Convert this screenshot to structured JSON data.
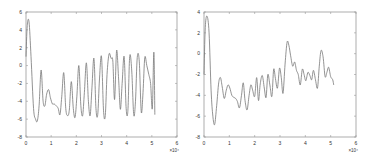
{
  "chart_data": [
    {
      "type": "line",
      "title": "",
      "xlabel": "",
      "ylabel": "",
      "x_exponent_label": "×10⁴",
      "xlim": [
        0,
        6
      ],
      "ylim": [
        -8,
        6
      ],
      "xticks": [
        "0",
        "1",
        "2",
        "3",
        "4",
        "5",
        "6"
      ],
      "yticks": [
        "6",
        "4",
        "2",
        "0",
        "-2",
        "-4",
        "-6",
        "-8"
      ],
      "ytick_values": [
        6,
        4,
        2,
        0,
        -2,
        -4,
        -6,
        -8
      ],
      "grid": false,
      "legend": null,
      "line_color": "#777777",
      "series": [
        {
          "name": "signal-1",
          "x": [
            0,
            0.05,
            0.12,
            0.2,
            0.3,
            0.38,
            0.45,
            0.52,
            0.6,
            0.68,
            0.75,
            0.82,
            0.9,
            0.97,
            1.05,
            1.12,
            1.2,
            1.28,
            1.35,
            1.42,
            1.5,
            1.58,
            1.65,
            1.72,
            1.8,
            1.88,
            1.95,
            2.02,
            2.1,
            2.18,
            2.25,
            2.32,
            2.4,
            2.48,
            2.55,
            2.62,
            2.7,
            2.78,
            2.85,
            2.92,
            3.0,
            3.08,
            3.15,
            3.22,
            3.3,
            3.38,
            3.45,
            3.52,
            3.6,
            3.68,
            3.75,
            3.82,
            3.9,
            3.98,
            4.05,
            4.12,
            4.2,
            4.28,
            4.35,
            4.42,
            4.5,
            4.58,
            4.65,
            4.72,
            4.8,
            4.88,
            4.95,
            5.02,
            5.08,
            5.12
          ],
          "y": [
            1.0,
            4.5,
            4.9,
            1.0,
            -4.8,
            -6.0,
            -6.2,
            -4.5,
            -0.5,
            -4.0,
            -4.5,
            -3.2,
            -2.7,
            -3.6,
            -4.3,
            -4.3,
            -4.5,
            -4.8,
            -5.5,
            -3.5,
            -0.8,
            -4.8,
            -5.6,
            -5.0,
            -1.8,
            -4.8,
            -5.8,
            -3.5,
            0.0,
            -4.5,
            -5.6,
            -3.0,
            0.3,
            -4.0,
            -5.6,
            -2.5,
            0.8,
            -4.8,
            -5.5,
            -1.5,
            1.0,
            -5.0,
            -5.6,
            -1.0,
            1.3,
            0.8,
            0.5,
            -3.8,
            1.7,
            -1.5,
            -4.9,
            -2.0,
            1.0,
            -4.8,
            -5.0,
            1.0,
            -0.5,
            -5.5,
            -4.0,
            0.9,
            0.5,
            -5.2,
            -3.0,
            0.9,
            0.0,
            -1.0,
            -2.0,
            -4.8,
            1.5,
            -5.5,
            1.2
          ]
        }
      ]
    },
    {
      "type": "line",
      "title": "",
      "xlabel": "",
      "ylabel": "",
      "x_exponent_label": "×10⁴",
      "xlim": [
        0,
        6
      ],
      "ylim": [
        -8,
        4
      ],
      "xticks": [
        "0",
        "1",
        "2",
        "3",
        "4",
        "5",
        "6"
      ],
      "yticks": [
        "4",
        "2",
        "0",
        "-2",
        "-4",
        "-6",
        "-8"
      ],
      "ytick_values": [
        4,
        2,
        0,
        -2,
        -4,
        -6,
        -8
      ],
      "grid": false,
      "legend": null,
      "line_color": "#777777",
      "series": [
        {
          "name": "signal-2",
          "x": [
            0,
            0.05,
            0.12,
            0.2,
            0.28,
            0.35,
            0.42,
            0.5,
            0.58,
            0.65,
            0.72,
            0.8,
            0.88,
            0.95,
            1.02,
            1.1,
            1.18,
            1.25,
            1.32,
            1.4,
            1.48,
            1.55,
            1.62,
            1.7,
            1.78,
            1.85,
            1.92,
            2.0,
            2.08,
            2.15,
            2.22,
            2.3,
            2.38,
            2.45,
            2.52,
            2.6,
            2.68,
            2.75,
            2.82,
            2.9,
            2.98,
            3.05,
            3.12,
            3.2,
            3.28,
            3.35,
            3.42,
            3.5,
            3.58,
            3.65,
            3.72,
            3.8,
            3.88,
            3.95,
            4.02,
            4.1,
            4.18,
            4.25,
            4.32,
            4.4,
            4.48,
            4.55,
            4.62,
            4.7,
            4.78,
            4.85,
            4.92,
            5.0,
            5.08,
            5.12
          ],
          "y": [
            -2.0,
            2.5,
            3.6,
            2.0,
            -3.5,
            -6.0,
            -6.8,
            -5.0,
            -2.8,
            -2.3,
            -3.2,
            -4.3,
            -3.5,
            -3.0,
            -3.3,
            -4.0,
            -4.2,
            -4.3,
            -4.6,
            -5.2,
            -4.0,
            -2.8,
            -4.5,
            -5.4,
            -4.0,
            -3.0,
            -3.5,
            -4.1,
            -2.3,
            -4.5,
            -2.9,
            -2.1,
            -3.3,
            -4.2,
            -2.0,
            -3.0,
            -4.1,
            -1.5,
            -2.4,
            -3.3,
            -1.4,
            -2.3,
            -3.8,
            -1.0,
            1.1,
            0.8,
            -0.2,
            -1.2,
            -0.8,
            -1.6,
            -2.0,
            -3.0,
            -1.5,
            -2.0,
            -2.6,
            -1.8,
            -2.1,
            -2.5,
            -1.6,
            -2.5,
            -3.3,
            -1.2,
            0.3,
            -0.3,
            -2.2,
            -1.8,
            -1.3,
            -2.2,
            -2.5,
            -3.0
          ]
        }
      ]
    }
  ],
  "figure": {
    "panels": [
      {
        "id": "left",
        "x_exponent_label": "×10⁴"
      },
      {
        "id": "right",
        "x_exponent_label": "×10⁴"
      }
    ]
  }
}
